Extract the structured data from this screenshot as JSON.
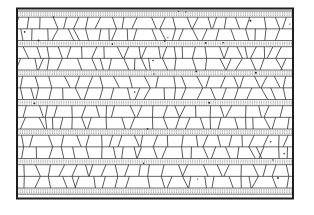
{
  "figure": {
    "canvas": {
      "width": 314,
      "height": 215,
      "background": "#ffffff"
    },
    "frame": {
      "x": 17,
      "y": 8.5,
      "width": 276,
      "height": 190,
      "color": "#1f1f1f",
      "stroke_width": 2
    },
    "stipple_bands": {
      "tops": [
        11,
        40.5,
        70,
        99.5,
        129,
        158.5,
        188
      ],
      "height": 6.2,
      "fill": "#f6f6f6",
      "border_color": "#4a4a4a",
      "border_width": 0.8,
      "dot_color": "#949494",
      "dot_row_offsets": [
        1.7,
        3.1,
        4.5
      ],
      "dot_dash": "0.7 1.6",
      "dot_line_width": 0.95
    },
    "cell_bands": {
      "rows_per_band": 2,
      "line_color": "#3d3d3d",
      "line_width": 0.85,
      "midline_color": "#3d3d3d",
      "midline_width": 0.8,
      "cell_width_min": 7,
      "cell_width_max": 16,
      "slant_min": 1.5,
      "slant_max": 6,
      "vertical_chance": 0.15,
      "flip_chance": 0.68,
      "chain_chance": 0.7,
      "chain_snap_px": 4
    },
    "specks": {
      "count": 26,
      "color": "#2b2b2b",
      "r_min": 0.5,
      "r_max": 1.0,
      "near_band_ratio": 0.6
    },
    "seed": 987654321
  }
}
